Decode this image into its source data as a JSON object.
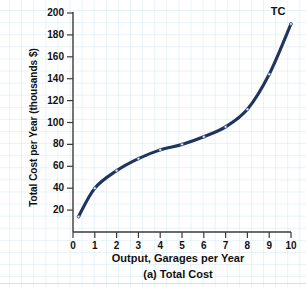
{
  "figure": {
    "caption": "(a) Total Cost",
    "series_label": "TC"
  },
  "axes": {
    "x_title": "Output, Garages per Year",
    "y_title": "Total Cost per Year (thousands $)",
    "x_ticks": [
      "0",
      "1",
      "2",
      "3",
      "4",
      "5",
      "6",
      "7",
      "8",
      "9",
      "10"
    ],
    "y_ticks": [
      "20",
      "40",
      "60",
      "80",
      "100",
      "120",
      "140",
      "160",
      "180",
      "200"
    ]
  },
  "colors": {
    "curve": "#1F3560",
    "marker": "#3A5382",
    "axis": "#3A3A3A",
    "grid": "#B0D6E6",
    "text": "#111111"
  },
  "chart_data": {
    "type": "line",
    "title": "(a) Total Cost",
    "xlabel": "Output, Garages per Year",
    "ylabel": "Total Cost per Year (thousands $)",
    "xlim": [
      0,
      10
    ],
    "ylim": [
      0,
      200
    ],
    "grid": true,
    "legend": "none",
    "annotations": [
      "TC"
    ],
    "series": [
      {
        "name": "TC",
        "x": [
          0.25,
          1,
          2,
          3,
          4,
          5,
          6,
          7,
          8,
          9,
          10
        ],
        "values": [
          14,
          40,
          56,
          67,
          75,
          80,
          87,
          96,
          112,
          144,
          190
        ]
      }
    ]
  }
}
